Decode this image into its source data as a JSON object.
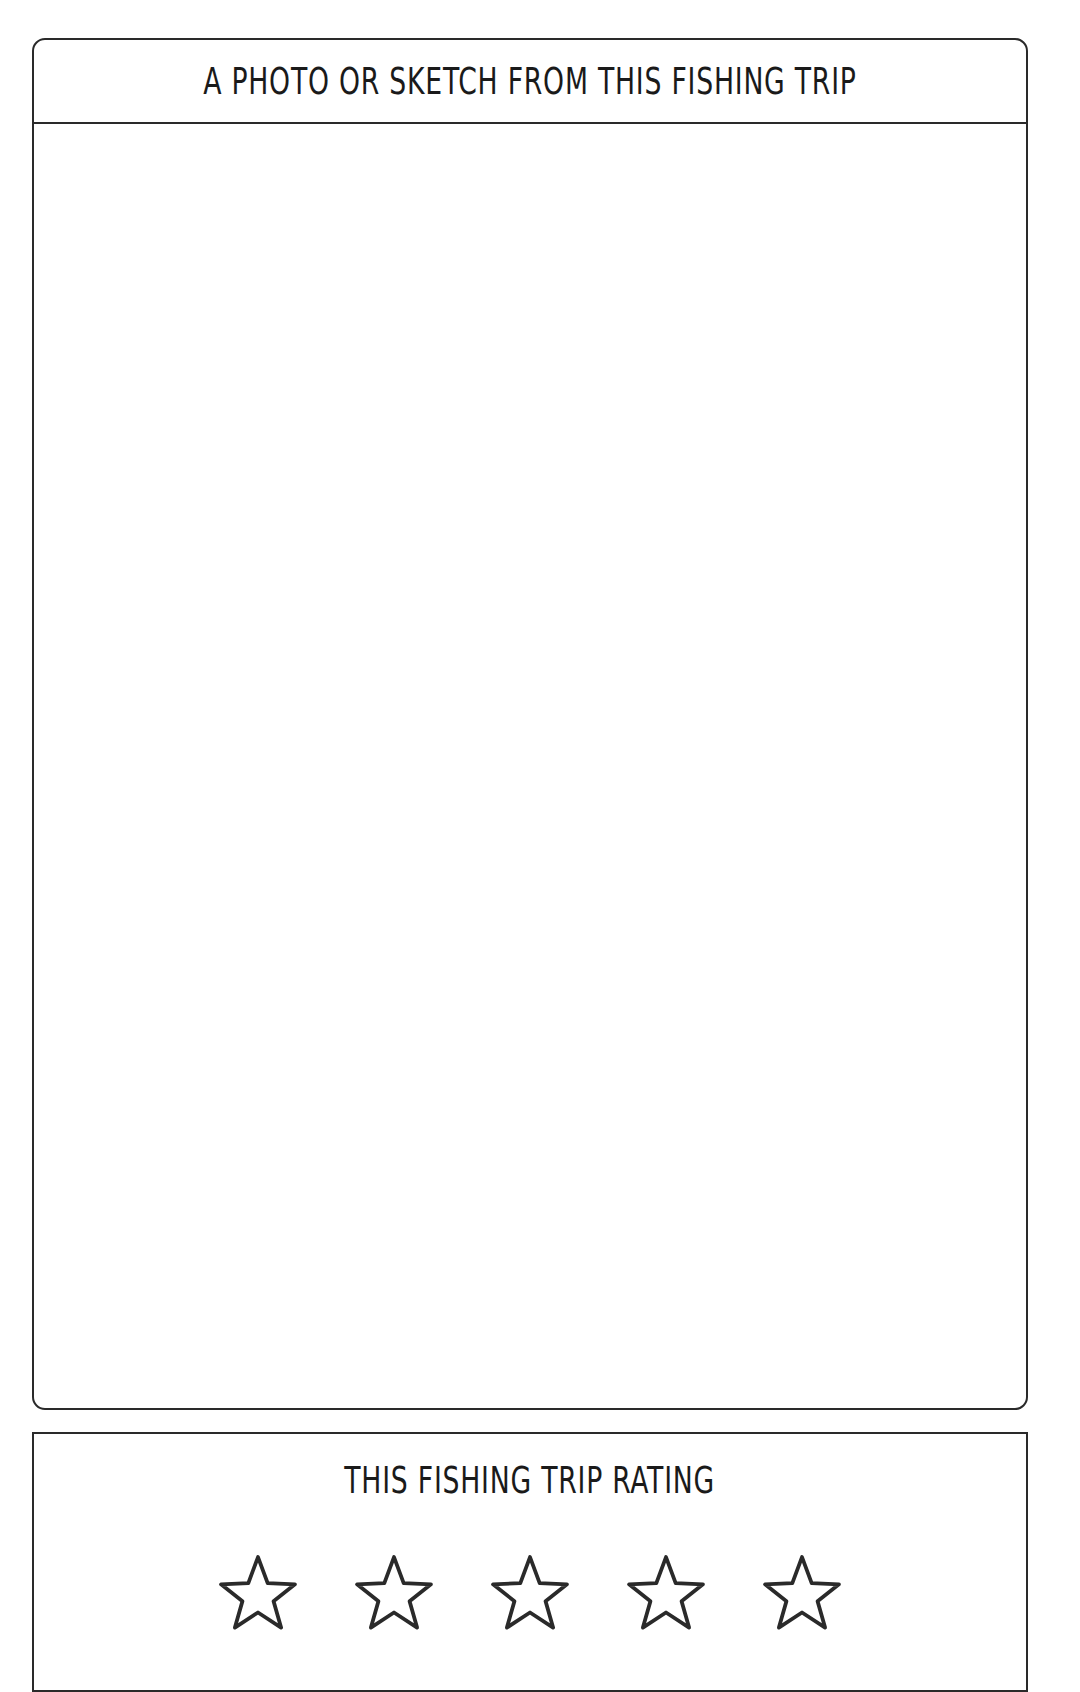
{
  "photo_section": {
    "title": "A PHOTO OR SKETCH FROM THIS FISHING TRIP"
  },
  "rating_section": {
    "title": "THIS FISHING TRIP RATING",
    "max_stars": 5,
    "selected_stars": 0,
    "star_icon": "star-outline-icon"
  },
  "colors": {
    "line": "#2a2a2a",
    "background": "#ffffff"
  }
}
